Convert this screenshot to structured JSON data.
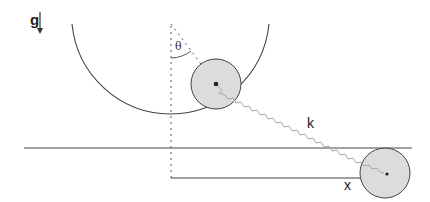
{
  "labels": {
    "gravity": "g",
    "angle": "θ",
    "spring_constant": "k",
    "displacement": "x"
  },
  "colors": {
    "stroke": "#333333",
    "disk_fill": "#dcdcdc",
    "spring": "#a8a8a8",
    "dashed": "#555555"
  },
  "elements": {
    "pivot": "pivot-point",
    "bowl": "semicircular-track",
    "inner_disk": "rolling-disk",
    "outer_disk": "sliding-disk",
    "ground": "horizontal-rail",
    "spring": "wavy-spring"
  }
}
